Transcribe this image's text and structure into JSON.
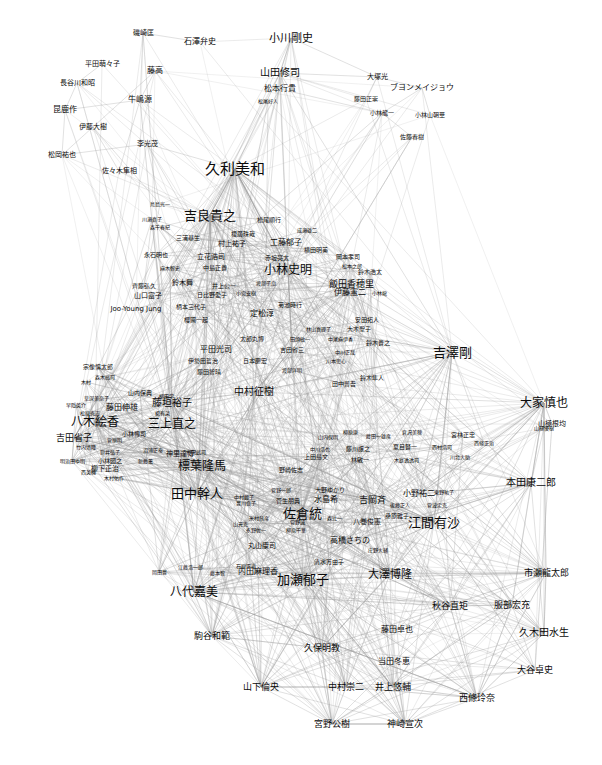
{
  "graph": {
    "title": "",
    "type": "force-directed-network",
    "background_color": "#ffffff",
    "edge_color": "#999999",
    "label_color": "#0a0a0a",
    "width": 602,
    "height": 765,
    "node_count": 216,
    "nodes": [
      {
        "label": "磯崎匡",
        "x": 143,
        "y": 33,
        "size": 7
      },
      {
        "label": "石澤弁史",
        "x": 200,
        "y": 42,
        "size": 8
      },
      {
        "label": "小川剛史",
        "x": 291,
        "y": 38,
        "size": 11
      },
      {
        "label": "平田萌々子",
        "x": 102,
        "y": 64,
        "size": 7
      },
      {
        "label": "藤高",
        "x": 155,
        "y": 71,
        "size": 8
      },
      {
        "label": "山田修司",
        "x": 280,
        "y": 73,
        "size": 10
      },
      {
        "label": "大塚光",
        "x": 377,
        "y": 77,
        "size": 7
      },
      {
        "label": "長谷川和昭",
        "x": 77,
        "y": 83,
        "size": 7
      },
      {
        "label": "松本行貴",
        "x": 280,
        "y": 89,
        "size": 8
      },
      {
        "label": "ブヨンメイジョウ",
        "x": 422,
        "y": 88,
        "size": 8
      },
      {
        "label": "牛嶋源",
        "x": 140,
        "y": 100,
        "size": 8
      },
      {
        "label": "藤田正崇",
        "x": 366,
        "y": 99,
        "size": 6
      },
      {
        "label": "昆鹿作",
        "x": 65,
        "y": 110,
        "size": 8
      },
      {
        "label": "松尾好人",
        "x": 268,
        "y": 101,
        "size": 5
      },
      {
        "label": "小林龍一",
        "x": 382,
        "y": 113,
        "size": 6
      },
      {
        "label": "小林山朝華",
        "x": 430,
        "y": 115,
        "size": 6
      },
      {
        "label": "伊藤大樹",
        "x": 93,
        "y": 127,
        "size": 7
      },
      {
        "label": "李光茂",
        "x": 147,
        "y": 144,
        "size": 7
      },
      {
        "label": "佐藤春樹",
        "x": 412,
        "y": 137,
        "size": 6
      },
      {
        "label": "松岡祐也",
        "x": 62,
        "y": 155,
        "size": 7
      },
      {
        "label": "佐々木隼相",
        "x": 119,
        "y": 171,
        "size": 7
      },
      {
        "label": "久利美和",
        "x": 235,
        "y": 169,
        "size": 15
      },
      {
        "label": "鳥島光一",
        "x": 160,
        "y": 204,
        "size": 5
      },
      {
        "label": "吉良貴之",
        "x": 210,
        "y": 215,
        "size": 13
      },
      {
        "label": "川瀬真子",
        "x": 152,
        "y": 219,
        "size": 5
      },
      {
        "label": "松尾順行",
        "x": 269,
        "y": 220,
        "size": 6
      },
      {
        "label": "森千春紀",
        "x": 160,
        "y": 227,
        "size": 5
      },
      {
        "label": "三浦基生",
        "x": 188,
        "y": 238,
        "size": 6
      },
      {
        "label": "榎廣珠哉",
        "x": 243,
        "y": 234,
        "size": 6
      },
      {
        "label": "成瀬雄二",
        "x": 307,
        "y": 230,
        "size": 5
      },
      {
        "label": "村上祐子",
        "x": 232,
        "y": 244,
        "size": 7
      },
      {
        "label": "工藤郁子",
        "x": 286,
        "y": 243,
        "size": 8
      },
      {
        "label": "横田明美",
        "x": 316,
        "y": 250,
        "size": 6
      },
      {
        "label": "永石明也",
        "x": 156,
        "y": 255,
        "size": 6
      },
      {
        "label": "立花浩司",
        "x": 211,
        "y": 257,
        "size": 7
      },
      {
        "label": "赤坂亮太",
        "x": 277,
        "y": 258,
        "size": 6
      },
      {
        "label": "麻木智史",
        "x": 170,
        "y": 268,
        "size": 5
      },
      {
        "label": "中島正貴",
        "x": 215,
        "y": 268,
        "size": 6
      },
      {
        "label": "小林史明",
        "x": 288,
        "y": 270,
        "size": 12
      },
      {
        "label": "松本之郎",
        "x": 352,
        "y": 266,
        "size": 5
      },
      {
        "label": "岡本孝司",
        "x": 348,
        "y": 257,
        "size": 6
      },
      {
        "label": "鈴木浩太",
        "x": 370,
        "y": 272,
        "size": 6
      },
      {
        "label": "齊藤弘久",
        "x": 144,
        "y": 286,
        "size": 6
      },
      {
        "label": "鈴木舞",
        "x": 182,
        "y": 283,
        "size": 7
      },
      {
        "label": "井上公一",
        "x": 224,
        "y": 286,
        "size": 6
      },
      {
        "label": "渡部子扇",
        "x": 266,
        "y": 283,
        "size": 5
      },
      {
        "label": "飯田香穂里",
        "x": 351,
        "y": 284,
        "size": 9
      },
      {
        "label": "山口富子",
        "x": 148,
        "y": 296,
        "size": 7
      },
      {
        "label": "日比野愛子",
        "x": 212,
        "y": 295,
        "size": 6
      },
      {
        "label": "小宮支樹",
        "x": 246,
        "y": 293,
        "size": 5
      },
      {
        "label": "小林龍",
        "x": 379,
        "y": 293,
        "size": 5
      },
      {
        "label": "伊藤憲二",
        "x": 350,
        "y": 293,
        "size": 8
      },
      {
        "label": "Joo-Young Jung",
        "x": 136,
        "y": 309,
        "size": 7
      },
      {
        "label": "柄本三代子",
        "x": 191,
        "y": 307,
        "size": 6
      },
      {
        "label": "菊池時行",
        "x": 290,
        "y": 305,
        "size": 6
      },
      {
        "label": "定松淳",
        "x": 262,
        "y": 314,
        "size": 8
      },
      {
        "label": "櫻圃一起",
        "x": 196,
        "y": 320,
        "size": 6
      },
      {
        "label": "安田拓人",
        "x": 367,
        "y": 320,
        "size": 6
      },
      {
        "label": "林山真理子",
        "x": 318,
        "y": 329,
        "size": 5
      },
      {
        "label": "大木聖子",
        "x": 359,
        "y": 329,
        "size": 6
      },
      {
        "label": "太郎丸博",
        "x": 252,
        "y": 339,
        "size": 6
      },
      {
        "label": "田頭敏一",
        "x": 300,
        "y": 339,
        "size": 5
      },
      {
        "label": "中尾麻伊香",
        "x": 340,
        "y": 339,
        "size": 5
      },
      {
        "label": "鈴木貴之",
        "x": 378,
        "y": 343,
        "size": 6
      },
      {
        "label": "平田光司",
        "x": 216,
        "y": 350,
        "size": 8
      },
      {
        "label": "吉田省三",
        "x": 292,
        "y": 350,
        "size": 6
      },
      {
        "label": "中川正哉",
        "x": 345,
        "y": 352,
        "size": 5
      },
      {
        "label": "吉澤剛",
        "x": 452,
        "y": 352,
        "size": 13
      },
      {
        "label": "伊勢田哲治",
        "x": 203,
        "y": 361,
        "size": 6
      },
      {
        "label": "日本慶宏",
        "x": 255,
        "y": 361,
        "size": 6
      },
      {
        "label": "川本思心",
        "x": 336,
        "y": 361,
        "size": 5
      },
      {
        "label": "宗像慎太郎",
        "x": 98,
        "y": 367,
        "size": 6
      },
      {
        "label": "藤田智晴",
        "x": 209,
        "y": 372,
        "size": 6
      },
      {
        "label": "渡部洋明",
        "x": 292,
        "y": 370,
        "size": 5
      },
      {
        "label": "森木高司",
        "x": 105,
        "y": 377,
        "size": 5
      },
      {
        "label": "鈴木隼人",
        "x": 372,
        "y": 378,
        "size": 6
      },
      {
        "label": "木村",
        "x": 86,
        "y": 382,
        "size": 5
      },
      {
        "label": "田中普吾",
        "x": 344,
        "y": 384,
        "size": 6
      },
      {
        "label": "山内保典",
        "x": 140,
        "y": 393,
        "size": 6
      },
      {
        "label": "中村征樹",
        "x": 254,
        "y": 392,
        "size": 10
      },
      {
        "label": "草深美奈子",
        "x": 96,
        "y": 398,
        "size": 5
      },
      {
        "label": "藤垣裕子",
        "x": 172,
        "y": 403,
        "size": 10
      },
      {
        "label": "柳田学",
        "x": 166,
        "y": 396,
        "size": 5
      },
      {
        "label": "早隠英介",
        "x": 76,
        "y": 405,
        "size": 5
      },
      {
        "label": "藤田伸雄",
        "x": 122,
        "y": 408,
        "size": 8
      },
      {
        "label": "大家慎也",
        "x": 544,
        "y": 403,
        "size": 12
      },
      {
        "label": "松原克志",
        "x": 90,
        "y": 413,
        "size": 5
      },
      {
        "label": "楊有菜",
        "x": 162,
        "y": 413,
        "size": 5
      },
      {
        "label": "山極根均",
        "x": 552,
        "y": 424,
        "size": 7
      },
      {
        "label": "八木絵香",
        "x": 95,
        "y": 422,
        "size": 12
      },
      {
        "label": "三上直之",
        "x": 172,
        "y": 424,
        "size": 12
      },
      {
        "label": "吉田省子",
        "x": 74,
        "y": 438,
        "size": 9
      },
      {
        "label": "小林博司",
        "x": 134,
        "y": 434,
        "size": 6
      },
      {
        "label": "菅原明",
        "x": 114,
        "y": 440,
        "size": 5
      },
      {
        "label": "竹内清隆",
        "x": 86,
        "y": 447,
        "size": 5
      },
      {
        "label": "筒井弘子",
        "x": 110,
        "y": 452,
        "size": 5
      },
      {
        "label": "沼浦正泰",
        "x": 153,
        "y": 450,
        "size": 5
      },
      {
        "label": "神里達博",
        "x": 180,
        "y": 454,
        "size": 7
      },
      {
        "label": "山内保明",
        "x": 328,
        "y": 437,
        "size": 5
      },
      {
        "label": "柳原康",
        "x": 350,
        "y": 432,
        "size": 5
      },
      {
        "label": "藤田一雄彦",
        "x": 378,
        "y": 436,
        "size": 5
      },
      {
        "label": "倉沢美穂",
        "x": 412,
        "y": 432,
        "size": 5
      },
      {
        "label": "宮林正忠",
        "x": 463,
        "y": 435,
        "size": 6
      },
      {
        "label": "山極優樹",
        "x": 544,
        "y": 428,
        "size": 5
      },
      {
        "label": "明治田ゆ明",
        "x": 72,
        "y": 461,
        "size": 5
      },
      {
        "label": "小林圀之",
        "x": 110,
        "y": 461,
        "size": 6
      },
      {
        "label": "新藤薫",
        "x": 145,
        "y": 461,
        "size": 5
      },
      {
        "label": "竹沢武司",
        "x": 196,
        "y": 452,
        "size": 5
      },
      {
        "label": "中川浩也",
        "x": 320,
        "y": 449,
        "size": 5
      },
      {
        "label": "藤川譲之",
        "x": 358,
        "y": 449,
        "size": 6
      },
      {
        "label": "夏目賢一",
        "x": 405,
        "y": 447,
        "size": 6
      },
      {
        "label": "西村浩司",
        "x": 442,
        "y": 447,
        "size": 5
      },
      {
        "label": "西條正治",
        "x": 484,
        "y": 443,
        "size": 5
      },
      {
        "label": "西英機",
        "x": 88,
        "y": 472,
        "size": 5
      },
      {
        "label": "柳下正治",
        "x": 105,
        "y": 469,
        "size": 7
      },
      {
        "label": "上田島文",
        "x": 316,
        "y": 457,
        "size": 6
      },
      {
        "label": "林敏一",
        "x": 360,
        "y": 460,
        "size": 6
      },
      {
        "label": "木庭透透司",
        "x": 406,
        "y": 460,
        "size": 5
      },
      {
        "label": "川北大助",
        "x": 460,
        "y": 457,
        "size": 5
      },
      {
        "label": "標葉隆馬",
        "x": 202,
        "y": 466,
        "size": 12
      },
      {
        "label": "木村佑作",
        "x": 114,
        "y": 478,
        "size": 5
      },
      {
        "label": "野崎佐志",
        "x": 291,
        "y": 470,
        "size": 6
      },
      {
        "label": "本田康二郎",
        "x": 531,
        "y": 483,
        "size": 10
      },
      {
        "label": "田中幹人",
        "x": 197,
        "y": 493,
        "size": 13
      },
      {
        "label": "中村麗子",
        "x": 244,
        "y": 497,
        "size": 5
      },
      {
        "label": "菅野一郎",
        "x": 281,
        "y": 490,
        "size": 5
      },
      {
        "label": "大野ゆかり",
        "x": 330,
        "y": 490,
        "size": 6
      },
      {
        "label": "東野祐子",
        "x": 444,
        "y": 492,
        "size": 5
      },
      {
        "label": "豊川良子",
        "x": 246,
        "y": 503,
        "size": 5
      },
      {
        "label": "菅生朋典",
        "x": 288,
        "y": 501,
        "size": 6
      },
      {
        "label": "水島希",
        "x": 326,
        "y": 500,
        "size": 8
      },
      {
        "label": "吉岡斉",
        "x": 372,
        "y": 500,
        "size": 9
      },
      {
        "label": "小野祐二",
        "x": 419,
        "y": 494,
        "size": 8
      },
      {
        "label": "佐倉統",
        "x": 302,
        "y": 513,
        "size": 13
      },
      {
        "label": "後藤正人",
        "x": 400,
        "y": 505,
        "size": 5
      },
      {
        "label": "菅波定克",
        "x": 437,
        "y": 505,
        "size": 5
      },
      {
        "label": "江間有沙",
        "x": 434,
        "y": 522,
        "size": 13
      },
      {
        "label": "桑原雅子",
        "x": 397,
        "y": 516,
        "size": 6
      },
      {
        "label": "八巻俊憲",
        "x": 367,
        "y": 522,
        "size": 7
      },
      {
        "label": "米村昌彦",
        "x": 259,
        "y": 518,
        "size": 5
      },
      {
        "label": "菅野誠",
        "x": 297,
        "y": 522,
        "size": 5
      },
      {
        "label": "森辻一",
        "x": 334,
        "y": 518,
        "size": 5
      },
      {
        "label": "山元克",
        "x": 240,
        "y": 524,
        "size": 5
      },
      {
        "label": "高橋さちの",
        "x": 350,
        "y": 541,
        "size": 8
      },
      {
        "label": "永野佐一",
        "x": 256,
        "y": 530,
        "size": 5
      },
      {
        "label": "柳原千華",
        "x": 296,
        "y": 530,
        "size": 5
      },
      {
        "label": "丸山康司",
        "x": 262,
        "y": 546,
        "size": 7
      },
      {
        "label": "庄野大輔",
        "x": 378,
        "y": 550,
        "size": 5
      },
      {
        "label": "大澤博隆",
        "x": 390,
        "y": 574,
        "size": 11
      },
      {
        "label": "清水万由子",
        "x": 329,
        "y": 562,
        "size": 6
      },
      {
        "label": "内田麻理香",
        "x": 258,
        "y": 572,
        "size": 8
      },
      {
        "label": "加瀬郁子",
        "x": 303,
        "y": 579,
        "size": 13
      },
      {
        "label": "石原正道",
        "x": 246,
        "y": 566,
        "size": 5
      },
      {
        "label": "江藤浩一郎",
        "x": 190,
        "y": 567,
        "size": 5
      },
      {
        "label": "岡田豊",
        "x": 159,
        "y": 572,
        "size": 5
      },
      {
        "label": "藤本智",
        "x": 217,
        "y": 573,
        "size": 5
      },
      {
        "label": "八代嘉美",
        "x": 194,
        "y": 592,
        "size": 12
      },
      {
        "label": "市瀬龍太郎",
        "x": 546,
        "y": 573,
        "size": 9
      },
      {
        "label": "秋谷直矩",
        "x": 450,
        "y": 606,
        "size": 9
      },
      {
        "label": "服部宏充",
        "x": 512,
        "y": 605,
        "size": 9
      },
      {
        "label": "駒谷和範",
        "x": 212,
        "y": 636,
        "size": 9
      },
      {
        "label": "藤田卓也",
        "x": 397,
        "y": 630,
        "size": 8
      },
      {
        "label": "久木田水生",
        "x": 544,
        "y": 633,
        "size": 10
      },
      {
        "label": "久保明教",
        "x": 322,
        "y": 648,
        "size": 9
      },
      {
        "label": "当田冬恵",
        "x": 394,
        "y": 662,
        "size": 8
      },
      {
        "label": "大谷卓史",
        "x": 535,
        "y": 670,
        "size": 9
      },
      {
        "label": "山下倫央",
        "x": 261,
        "y": 687,
        "size": 9
      },
      {
        "label": "中村崇二",
        "x": 346,
        "y": 687,
        "size": 9
      },
      {
        "label": "井上悠輔",
        "x": 393,
        "y": 687,
        "size": 9
      },
      {
        "label": "西條玲奈",
        "x": 477,
        "y": 698,
        "size": 9
      },
      {
        "label": "宮野公樹",
        "x": 332,
        "y": 724,
        "size": 9
      },
      {
        "label": "神崎宣次",
        "x": 405,
        "y": 724,
        "size": 9
      }
    ],
    "clusters": [
      {
        "name": "top-left-cluster",
        "center_x": 150,
        "center_y": 100
      },
      {
        "name": "top-right-cluster",
        "center_x": 400,
        "center_y": 100
      },
      {
        "name": "upper-middle-cluster",
        "center_x": 250,
        "center_y": 270
      },
      {
        "name": "left-middle-cluster",
        "center_x": 130,
        "center_y": 430
      },
      {
        "name": "center-bottom-cluster",
        "center_x": 320,
        "center_y": 560
      },
      {
        "name": "right-cluster",
        "center_x": 520,
        "center_y": 520
      }
    ]
  }
}
